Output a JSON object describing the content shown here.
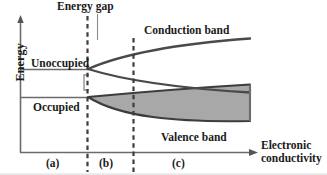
{
  "figure": {
    "type": "band-structure-diagram",
    "axes": {
      "y_label": "Energy",
      "x_label_line1": "Electronic",
      "x_label_line2": "conductivity",
      "y_axis_x": 20,
      "x_axis_y": 152,
      "x_axis_end": 258,
      "y_axis_top": 18
    },
    "annotations": {
      "energy_gap": "Energy gap",
      "unoccupied": "Unoccupied",
      "occupied": "Occupied",
      "conduction_band": "Conduction band",
      "valence_band": "Valence band"
    },
    "regions": [
      {
        "key": "a",
        "label": "(a)",
        "x_start": 20,
        "x_end": 87
      },
      {
        "key": "b",
        "label": "(b)",
        "x_start": 87,
        "x_end": 133
      },
      {
        "key": "c",
        "label": "(c)",
        "x_start": 133,
        "x_end": 258
      }
    ],
    "dashed_lines_x": [
      87,
      133
    ],
    "levels": {
      "unoccupied_level_y": 69,
      "occupied_level_y": 97,
      "band_origin_x": 87,
      "band_end_x": 250
    },
    "colors": {
      "line": "#4a4a4a",
      "band_stroke": "#3d3d3d",
      "valence_fill": "#a8a8a8",
      "text": "#1a1a1a",
      "dashed": "#3d3d3d",
      "axis": "#6b6b6b"
    }
  }
}
